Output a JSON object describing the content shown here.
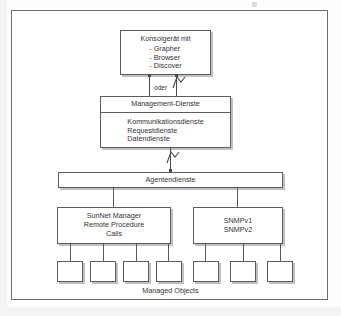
{
  "diagram": {
    "frame": {
      "visible": true
    },
    "console_box": {
      "title": "Konsolgerät mit",
      "items": [
        "- Grapher",
        "- Browser",
        "- Discover"
      ]
    },
    "connector_label": "oder",
    "management_box": {
      "header": "Management-Dienste",
      "services": [
        "Kommunikationsdienste",
        "Requestdienste",
        "Datendienste"
      ]
    },
    "agent_box": {
      "label": "Agentendienste"
    },
    "protocol_boxes": [
      {
        "lines": [
          "SunNet Manager",
          "Remote Procedure",
          "Calls"
        ],
        "children": 4
      },
      {
        "lines": [
          "SNMPv1",
          "SNMPv2"
        ],
        "children": 3
      }
    ],
    "managed_objects": {
      "label": "Managed Objects",
      "count": 7,
      "left_group": 4,
      "right_group": 3
    },
    "colors": {
      "line": "#5c5c5c",
      "frame": "#6e6e6e",
      "text": "#333333",
      "box_fill": "#ffffff",
      "shadow": "#8c8c8c",
      "page": "#fdfdfc"
    }
  }
}
